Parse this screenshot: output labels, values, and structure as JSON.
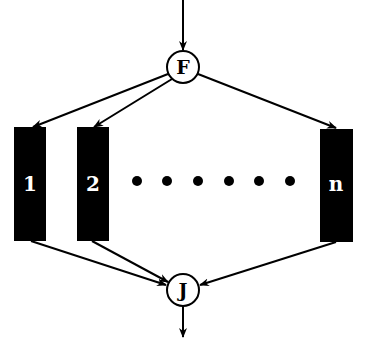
{
  "diagram": {
    "fork": {
      "label": "F",
      "cx": 183,
      "cy": 67,
      "r": 16
    },
    "join": {
      "label": "J",
      "cx": 183,
      "cy": 290,
      "r": 16
    },
    "boxes": [
      {
        "label": "1",
        "x": 14,
        "y": 127,
        "w": 32,
        "h": 114
      },
      {
        "label": "2",
        "x": 77,
        "y": 127,
        "w": 32,
        "h": 114
      },
      {
        "label": "n",
        "x": 320,
        "y": 129,
        "w": 33,
        "h": 113
      }
    ],
    "ellipsis_dots": [
      137,
      167,
      198,
      229,
      259,
      290
    ],
    "ellipsis_y": 181,
    "colors": {
      "box_fill": "#000000",
      "box_text": "#ffffff",
      "line": "#000000"
    }
  }
}
